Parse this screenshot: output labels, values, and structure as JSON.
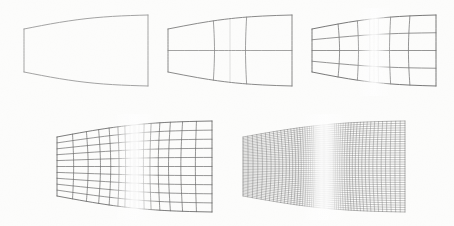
{
  "figure": {
    "background_color": "#fdfdfc",
    "line_color_light": "#9a9a9a",
    "line_color_mid": "#6e6e6e",
    "line_color_dark": "#4a4a4a",
    "line_color_darkest": "#333333"
  },
  "panels": [
    {
      "id": "panel-1",
      "label": "Level 0 mesh",
      "level": 0,
      "columns": 1,
      "rows": 1,
      "cells": 1,
      "bounds": {
        "x": 24,
        "y": 14,
        "width": 124,
        "height": 74
      },
      "stroke": "#9a9a9a",
      "stroke_width": 0.8,
      "corners": {
        "top_left_y": 29,
        "bottom_left_y": 72,
        "top_right_y": 15,
        "bottom_right_y": 86
      }
    },
    {
      "id": "panel-2",
      "label": "Level 1 mesh",
      "level": 1,
      "columns": 4,
      "rows": 2,
      "cells": 8,
      "bounds": {
        "x": 168,
        "y": 14,
        "width": 124,
        "height": 74
      },
      "stroke": "#7d7d7d",
      "stroke_width": 0.8,
      "corners": {
        "top_left_y": 29,
        "bottom_left_y": 72,
        "top_right_y": 15,
        "bottom_right_y": 86
      }
    },
    {
      "id": "panel-3",
      "label": "Level 2 mesh",
      "level": 2,
      "columns": 8,
      "rows": 4,
      "cells": 32,
      "bounds": {
        "x": 312,
        "y": 14,
        "width": 124,
        "height": 74
      },
      "stroke": "#6a6a6a",
      "stroke_width": 0.8,
      "corners": {
        "top_left_y": 29,
        "bottom_left_y": 72,
        "top_right_y": 15,
        "bottom_right_y": 86
      }
    },
    {
      "id": "panel-4",
      "label": "Level 3 mesh",
      "level": 3,
      "columns": 18,
      "rows": 10,
      "cells": 180,
      "bounds": {
        "x": 57,
        "y": 120,
        "width": 155,
        "height": 92
      },
      "stroke": "#585858",
      "stroke_width": 0.7,
      "corners": {
        "top_left_y": 137,
        "bottom_left_y": 196,
        "top_right_y": 121,
        "bottom_right_y": 212
      }
    },
    {
      "id": "panel-5",
      "label": "Level 4 mesh",
      "level": 4,
      "columns": 64,
      "rows": 40,
      "cells": 2560,
      "bounds": {
        "x": 243,
        "y": 120,
        "width": 162,
        "height": 92
      },
      "stroke": "#4a4a4a",
      "stroke_width": 0.35,
      "corners": {
        "top_left_y": 137,
        "bottom_left_y": 196,
        "top_right_y": 121,
        "bottom_right_y": 212
      }
    }
  ],
  "geometry": {
    "clustering": "edge-clustered (dense near left and right boundaries, sparse at center)",
    "center_gap_fraction": 0.3,
    "curvature": "interior grid lines bow inward toward the vertical centerline",
    "left_edge_vertical": true,
    "right_edge_taller": true
  }
}
